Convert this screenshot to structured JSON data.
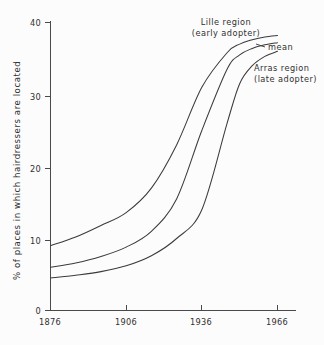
{
  "chart_data": {
    "type": "line",
    "title": "",
    "subtitle": "",
    "xlabel": "",
    "ylabel": "% of places in which hairdressers are located",
    "xlim": [
      1876,
      1981
    ],
    "ylim": [
      0,
      40
    ],
    "grid": false,
    "legend_position": "inline-annotations",
    "x_ticks": [
      "1876",
      "1906",
      "1936",
      "1966"
    ],
    "x_tick_values": [
      1876,
      1906,
      1936,
      1966
    ],
    "y_ticks": [
      "0",
      "10",
      "20",
      "30",
      "40"
    ],
    "y_tick_values": [
      0,
      10,
      20,
      30,
      40
    ],
    "x": [
      1876,
      1886,
      1896,
      1906,
      1916,
      1926,
      1936,
      1946,
      1951,
      1956,
      1961,
      1966
    ],
    "series": [
      {
        "name": "Lille region (early adopter)",
        "label_line1": "Lille region",
        "label_line2": "(early adopter)",
        "values": [
          9.0,
          10.2,
          11.8,
          13.6,
          17.0,
          23.0,
          31.0,
          35.8,
          37.0,
          37.6,
          38.0,
          38.2
        ],
        "color": "#3b3b3b"
      },
      {
        "name": "mean",
        "label_line1": "mean",
        "label_line2": "",
        "values": [
          6.0,
          6.6,
          7.5,
          8.8,
          11.0,
          15.5,
          25.0,
          33.5,
          35.5,
          36.4,
          36.9,
          37.2
        ],
        "color": "#3b3b3b"
      },
      {
        "name": "Arras region (late adopter)",
        "label_line1": "Arras region",
        "label_line2": "(late adopter)",
        "values": [
          4.5,
          4.9,
          5.4,
          6.2,
          7.6,
          10.0,
          14.0,
          26.0,
          31.5,
          34.0,
          35.3,
          36.0
        ],
        "color": "#3b3b3b"
      }
    ],
    "annotations": [
      {
        "id": "lille",
        "line1": "Lille region",
        "line2": "(early adopter)"
      },
      {
        "id": "mean",
        "line1": "mean",
        "line2": ""
      },
      {
        "id": "arras",
        "line1": "Arras region",
        "line2": "(late adopter)"
      }
    ]
  },
  "figure": {
    "background_color": "#fcfcfc",
    "line_color": "#3b3b3b",
    "axis_color": "#4a4a4a"
  }
}
